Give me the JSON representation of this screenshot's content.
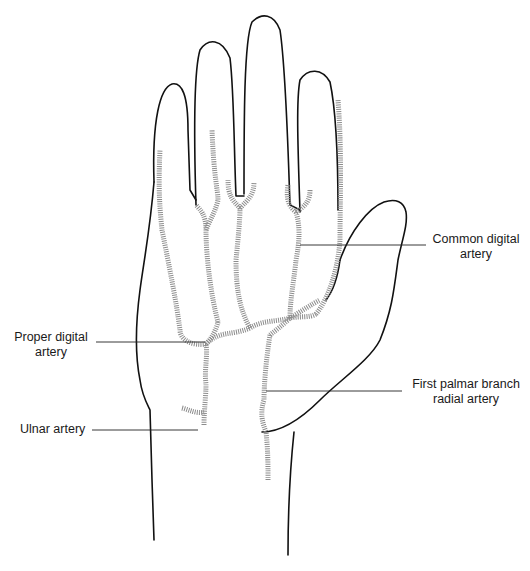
{
  "figure": {
    "labels": {
      "common_digital": [
        "Common digital",
        "artery"
      ],
      "proper_digital": [
        "Proper digital",
        "artery"
      ],
      "first_palmar": [
        "First palmar branch",
        "radial artery"
      ],
      "ulnar": [
        "Ulnar artery"
      ]
    },
    "colors": {
      "outline": "#111111",
      "artery": "#8c8c8c",
      "leader": "#222222",
      "text": "#1a1a1a",
      "background": "#ffffff"
    }
  }
}
